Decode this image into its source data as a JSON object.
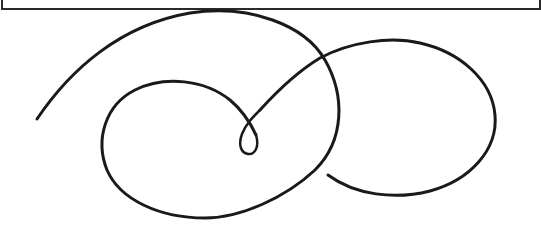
{
  "artwork": {
    "description": "Decorative calligraphic flourish with a small loop and two large swirls",
    "stroke_color": "#1a1a1a",
    "background_color": "#ffffff",
    "frame_color": "#2a2a2a"
  }
}
